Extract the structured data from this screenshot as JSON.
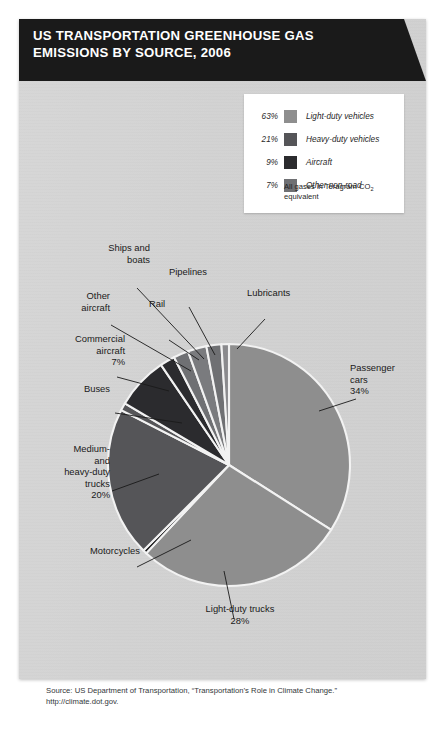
{
  "banner": {
    "line1": "US TRANSPORTATION GREENHOUSE GAS",
    "line2": "EMISSIONS BY SOURCE, 2006"
  },
  "legend": {
    "items": [
      {
        "pct": "63%",
        "label": "Light-duty vehicles",
        "color": "#8e8e8e"
      },
      {
        "pct": "21%",
        "label": "Heavy-duty vehicles",
        "color": "#555558"
      },
      {
        "pct": "9%",
        "label": "Aircraft",
        "color": "#2b2b2e"
      },
      {
        "pct": "7%",
        "label": "Other non-road",
        "color": "#6f7073"
      }
    ],
    "note_line1": "All gases in Teragram CO",
    "note_sub": "2",
    "note_line2": "equivalent"
  },
  "labels": {
    "ships_and_boats": "Ships and\nboats",
    "other_aircraft": "Other\naircraft",
    "commercial_aircraft": "Commercial\naircraft\n7%",
    "buses": "Buses",
    "medium_heavy_trucks": "Medium-\nand\nheavy-duty\ntrucks\n20%",
    "motorcycles": "Motorcycles",
    "pipelines": "Pipelines",
    "rail": "Rail",
    "lubricants": "Lubricants",
    "passenger_cars": "Passenger\ncars\n34%",
    "light_duty_trucks": "Light-duty trucks\n28%"
  },
  "source": {
    "line1": "Source: US Department of Transportation, “Transportation’s Role in Climate Change.”",
    "line2": "http://climate.dot.gov."
  },
  "chart_data": {
    "type": "pie",
    "title": "US Transportation Greenhouse Gas Emissions by Source, 2006",
    "unit": "Teragram CO2 equivalent",
    "legend_position": "top-right",
    "grid": false,
    "start_angle_deg": 0,
    "direction": "clockwise",
    "categories": [
      "Passenger cars",
      "Light-duty trucks",
      "Motorcycles",
      "Medium- and heavy-duty trucks",
      "Buses",
      "Commercial aircraft",
      "Other aircraft",
      "Ships and boats",
      "Rail",
      "Pipelines",
      "Lubricants"
    ],
    "values": [
      34,
      28,
      0.5,
      20,
      1,
      7,
      2,
      2,
      2.5,
      2,
      1
    ],
    "labels": [
      "34%",
      "28%",
      "",
      "20%",
      "",
      "7%",
      "",
      "",
      "",
      "",
      ""
    ],
    "colors": [
      "#8e8e8e",
      "#8e8e8e",
      "#141416",
      "#555558",
      "#555558",
      "#2b2b2e",
      "#2b2b2e",
      "#6f7073",
      "#7a7b7e",
      "#6f7073",
      "#8a8a8d"
    ],
    "groups": [
      {
        "name": "Light-duty vehicles",
        "pct": 63,
        "color": "#8e8e8e"
      },
      {
        "name": "Heavy-duty vehicles",
        "pct": 21,
        "color": "#555558"
      },
      {
        "name": "Aircraft",
        "pct": 9,
        "color": "#2b2b2e"
      },
      {
        "name": "Other non-road",
        "pct": 7,
        "color": "#6f7073"
      }
    ]
  }
}
